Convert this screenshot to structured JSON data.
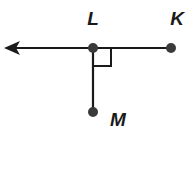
{
  "diagram": {
    "type": "geometry",
    "colors": {
      "stroke": "#1a1a1a",
      "point": "#3a3a3a",
      "background": "#ffffff"
    },
    "points": [
      {
        "id": "L",
        "label": "L",
        "x": 93,
        "y": 48,
        "label_x": 93,
        "label_y": 25
      },
      {
        "id": "K",
        "label": "K",
        "x": 171,
        "y": 48,
        "label_x": 177,
        "label_y": 25
      },
      {
        "id": "M",
        "label": "M",
        "x": 93,
        "y": 112,
        "label_x": 118,
        "label_y": 126
      }
    ],
    "elements": [
      {
        "kind": "ray",
        "from": "K",
        "through": "L",
        "arrow": "left",
        "arrow_tip_x": 5
      },
      {
        "kind": "segment",
        "from": "L",
        "to": "M"
      },
      {
        "kind": "right-angle-marker",
        "at": "L",
        "size": 18
      }
    ]
  }
}
